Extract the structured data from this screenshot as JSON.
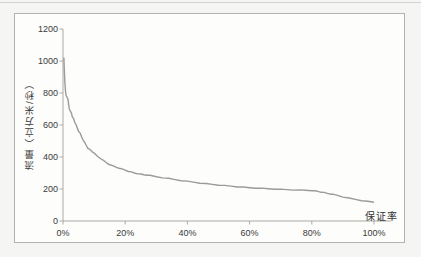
{
  "colors": {
    "curve": "#9a9a9a",
    "axis": "#a9a9a4",
    "text": "#3a3a3a",
    "frame_border": "#b3b3ae",
    "plot_background": "#fdfdfc",
    "page_background": "#f5f5f3"
  },
  "chart_data": {
    "type": "line",
    "title": "",
    "xlabel": "保证率",
    "ylabel": "流量（立方米/秒）",
    "xlim": [
      0,
      100
    ],
    "ylim": [
      0,
      1200
    ],
    "grid": false,
    "legend": "none",
    "x_ticks": [
      {
        "value": 0,
        "label": "0%"
      },
      {
        "value": 20,
        "label": "20%"
      },
      {
        "value": 40,
        "label": "40%"
      },
      {
        "value": 60,
        "label": "60%"
      },
      {
        "value": 80,
        "label": "80%"
      },
      {
        "value": 100,
        "label": "100%"
      }
    ],
    "y_ticks": [
      {
        "value": 0,
        "label": "0"
      },
      {
        "value": 200,
        "label": "200"
      },
      {
        "value": 400,
        "label": "400"
      },
      {
        "value": 600,
        "label": "600"
      },
      {
        "value": 800,
        "label": "800"
      },
      {
        "value": 1000,
        "label": "1000"
      },
      {
        "value": 1200,
        "label": "1200"
      }
    ],
    "series": [
      {
        "points": [
          [
            0.3,
            1020
          ],
          [
            0.4,
            962
          ],
          [
            0.5,
            905
          ],
          [
            0.6,
            862
          ],
          [
            0.8,
            812
          ],
          [
            1,
            786
          ],
          [
            1.3,
            772
          ],
          [
            1.6,
            760
          ],
          [
            1.8,
            732
          ],
          [
            2,
            702
          ],
          [
            2.3,
            688
          ],
          [
            2.7,
            678
          ],
          [
            3,
            650
          ],
          [
            3.4,
            641
          ],
          [
            3.8,
            617
          ],
          [
            4.2,
            600
          ],
          [
            4.6,
            581
          ],
          [
            5,
            562
          ],
          [
            5.5,
            548
          ],
          [
            6,
            525
          ],
          [
            6.5,
            506
          ],
          [
            7,
            489
          ],
          [
            7.5,
            472
          ],
          [
            8,
            456
          ],
          [
            8.5,
            448
          ],
          [
            9,
            440
          ],
          [
            9.5,
            432
          ],
          [
            10,
            424
          ],
          [
            11,
            406
          ],
          [
            12,
            392
          ],
          [
            13,
            378
          ],
          [
            14,
            364
          ],
          [
            15,
            353
          ],
          [
            16,
            345
          ],
          [
            17,
            337
          ],
          [
            18,
            331
          ],
          [
            19,
            324
          ],
          [
            20,
            318
          ],
          [
            21,
            311
          ],
          [
            22,
            305
          ],
          [
            23,
            300
          ],
          [
            24,
            296
          ],
          [
            25,
            292
          ],
          [
            26,
            289
          ],
          [
            27,
            287
          ],
          [
            28,
            284
          ],
          [
            30,
            277
          ],
          [
            32,
            271
          ],
          [
            34,
            265
          ],
          [
            36,
            259
          ],
          [
            38,
            253
          ],
          [
            40,
            248
          ],
          [
            42,
            243
          ],
          [
            44,
            238
          ],
          [
            46,
            233
          ],
          [
            48,
            229
          ],
          [
            50,
            225
          ],
          [
            52,
            221
          ],
          [
            54,
            218
          ],
          [
            56,
            214
          ],
          [
            58,
            211
          ],
          [
            60,
            208
          ],
          [
            62,
            206
          ],
          [
            64,
            204
          ],
          [
            66,
            202
          ],
          [
            68,
            200
          ],
          [
            70,
            198
          ],
          [
            72,
            196
          ],
          [
            74,
            195
          ],
          [
            76,
            193
          ],
          [
            78,
            192
          ],
          [
            80,
            190
          ],
          [
            81,
            188
          ],
          [
            82,
            185
          ],
          [
            83,
            181
          ],
          [
            84,
            177
          ],
          [
            85,
            173
          ],
          [
            86,
            169
          ],
          [
            87,
            165
          ],
          [
            88,
            161
          ],
          [
            90,
            151
          ],
          [
            92,
            142
          ],
          [
            94,
            135
          ],
          [
            96,
            128
          ],
          [
            98,
            122
          ],
          [
            100,
            117
          ]
        ]
      }
    ]
  }
}
